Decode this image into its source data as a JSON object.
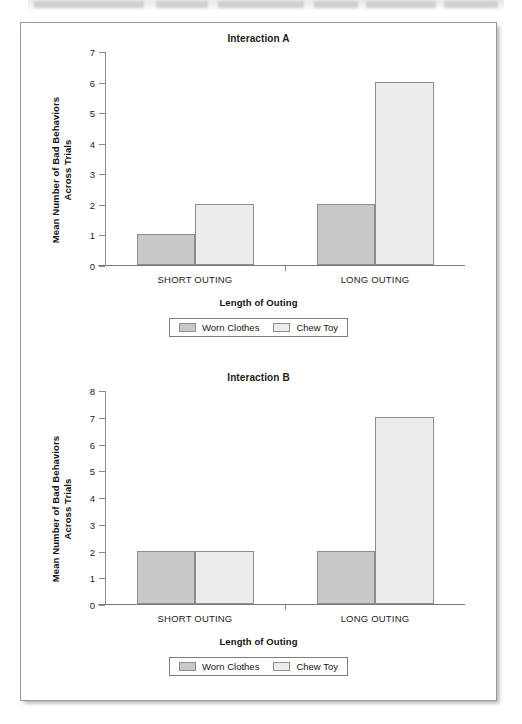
{
  "figure": {
    "frame_border_color": "#9a9a9a",
    "background": "#ffffff"
  },
  "series_colors": {
    "worn_clothes": "#c9c9c9",
    "chew_toy": "#ececec"
  },
  "charts": [
    {
      "id": "interaction-a",
      "title": "Interaction A",
      "ylabel_line1": "Mean Number of Bad Behaviors",
      "ylabel_line2": "Across Trials",
      "xlabel": "Length of Outing",
      "yticks": [
        "7",
        "6",
        "5",
        "4",
        "3",
        "2",
        "1",
        "0"
      ],
      "categories": [
        "SHORT OUTING",
        "LONG OUTING"
      ],
      "legend": [
        "Worn Clothes",
        "Chew Toy"
      ]
    },
    {
      "id": "interaction-b",
      "title": "Interaction B",
      "ylabel_line1": "Mean Number of Bad Behaviors",
      "ylabel_line2": "Across Trials",
      "xlabel": "Length of Outing",
      "yticks": [
        "8",
        "7",
        "6",
        "5",
        "4",
        "3",
        "2",
        "1",
        "0"
      ],
      "categories": [
        "SHORT OUTING",
        "LONG OUTING"
      ],
      "legend": [
        "Worn Clothes",
        "Chew Toy"
      ]
    }
  ],
  "chart_data": [
    {
      "type": "bar",
      "title": "Interaction A",
      "xlabel": "Length of Outing",
      "ylabel": "Mean Number of Bad Behaviors Across Trials",
      "categories": [
        "SHORT OUTING",
        "LONG OUTING"
      ],
      "series": [
        {
          "name": "Worn Clothes",
          "values": [
            1,
            2
          ],
          "color": "#c9c9c9"
        },
        {
          "name": "Chew Toy",
          "values": [
            2,
            6
          ],
          "color": "#ececec"
        }
      ],
      "ylim": [
        0,
        7
      ],
      "ytick_values": [
        0,
        1,
        2,
        3,
        4,
        5,
        6,
        7
      ],
      "grid": false,
      "legend_position": "bottom"
    },
    {
      "type": "bar",
      "title": "Interaction B",
      "xlabel": "Length of Outing",
      "ylabel": "Mean Number of Bad Behaviors Across Trials",
      "categories": [
        "SHORT OUTING",
        "LONG OUTING"
      ],
      "series": [
        {
          "name": "Worn Clothes",
          "values": [
            2,
            2
          ],
          "color": "#c9c9c9"
        },
        {
          "name": "Chew Toy",
          "values": [
            2,
            7
          ],
          "color": "#ececec"
        }
      ],
      "ylim": [
        0,
        8
      ],
      "ytick_values": [
        0,
        1,
        2,
        3,
        4,
        5,
        6,
        7,
        8
      ],
      "grid": false,
      "legend_position": "bottom"
    }
  ]
}
